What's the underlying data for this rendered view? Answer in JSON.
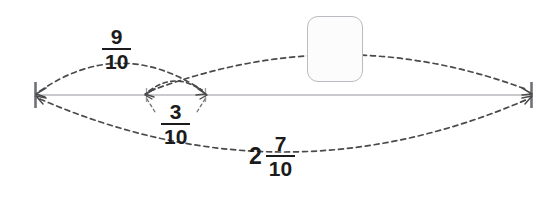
{
  "diagram": {
    "type": "number-line-with-jump-arcs",
    "line": {
      "x_start": 35,
      "x_end": 532,
      "y": 95,
      "color": "#b6b9bd"
    },
    "ticks": [
      {
        "name": "left-endpoint-tick",
        "x": 35,
        "height": 26,
        "weight": "bold"
      },
      {
        "name": "inner-tick-left",
        "x": 146,
        "height": 14,
        "weight": "light"
      },
      {
        "name": "inner-tick-right",
        "x": 205,
        "height": 14,
        "weight": "light"
      },
      {
        "name": "right-endpoint-tick",
        "x": 532,
        "height": 26,
        "weight": "bold"
      }
    ],
    "arc_color": "#4a4a4a",
    "arcs": [
      {
        "name": "arc-nine-tenths",
        "label": "9/10",
        "from_x": 35,
        "to_x": 205,
        "side": "above",
        "arrowheads": "both"
      },
      {
        "name": "arc-three-tenths",
        "label": "3/10",
        "from_x": 146,
        "to_x": 205,
        "side": "above",
        "arrowheads": "both"
      },
      {
        "name": "arc-unknown",
        "label": "",
        "from_x": 146,
        "to_x": 532,
        "side": "above",
        "arrowheads": "both"
      },
      {
        "name": "arc-two-and-seven-tenths",
        "label": "2 7/10",
        "from_x": 35,
        "to_x": 532,
        "side": "below",
        "arrowheads": "both"
      }
    ]
  },
  "labels": {
    "nine_tenths": {
      "numerator": "9",
      "denominator": "10"
    },
    "three_tenths": {
      "numerator": "3",
      "denominator": "10"
    },
    "two_and_seven_tenths": {
      "whole": "2",
      "numerator": "7",
      "denominator": "10"
    }
  },
  "answer_box": {
    "name": "answer-input-box",
    "value": "",
    "placeholder": ""
  }
}
